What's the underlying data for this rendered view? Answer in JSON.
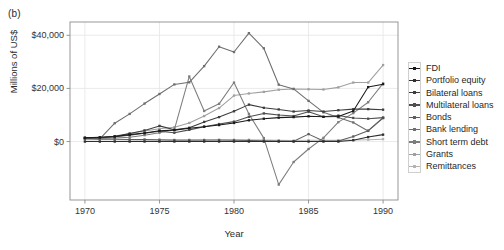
{
  "panel_label": "(b)",
  "colors": {
    "background": "#ffffff",
    "panel_border": "#8c8c8c",
    "grid_major": "#e8e8e8",
    "axis_text": "#333333",
    "legend_border": "#cfcfcf"
  },
  "chart_data": {
    "type": "line",
    "title": "",
    "xlabel": "Year",
    "ylabel": "Millions of US$",
    "xlim": [
      1969,
      1991
    ],
    "ylim": [
      -22000,
      45000
    ],
    "xticks": [
      1970,
      1975,
      1980,
      1985,
      1990
    ],
    "xticklabels": [
      "1970",
      "1975",
      "1980",
      "1985",
      "1990"
    ],
    "yticks": [
      0,
      20000,
      40000
    ],
    "yticklabels": [
      "$0",
      "$20,000",
      "$40,000"
    ],
    "grid": true,
    "legend_position": "right",
    "x": [
      1970,
      1971,
      1972,
      1973,
      1974,
      1975,
      1976,
      1977,
      1978,
      1979,
      1980,
      1981,
      1982,
      1983,
      1984,
      1985,
      1986,
      1987,
      1988,
      1989,
      1990
    ],
    "series": [
      {
        "name": "FDI",
        "color": "#1a1a1a",
        "values": [
          1400,
          1600,
          1900,
          2600,
          3200,
          4100,
          4300,
          5000,
          5600,
          6200,
          7000,
          8000,
          8600,
          9000,
          9200,
          9500,
          9300,
          9400,
          11500,
          20500,
          21600
        ]
      },
      {
        "name": "Portfolio equity",
        "color": "#2e2e2e",
        "values": [
          0,
          0,
          0,
          0,
          0,
          0,
          0,
          0,
          0,
          0,
          0,
          0,
          0,
          0,
          0,
          0,
          0,
          0,
          500,
          1700,
          2600
        ]
      },
      {
        "name": "Bilateral loans",
        "color": "#3d3d3d",
        "values": [
          1300,
          1500,
          2000,
          3000,
          4200,
          5900,
          4400,
          5200,
          7400,
          9200,
          11400,
          13900,
          12700,
          12100,
          11300,
          11700,
          11300,
          11800,
          12200,
          12200,
          12000
        ]
      },
      {
        "name": "Multilateral loans",
        "color": "#4f4f4f",
        "values": [
          1200,
          1400,
          1800,
          2400,
          3100,
          3900,
          3300,
          4400,
          5600,
          6600,
          7500,
          9300,
          10600,
          10000,
          9600,
          11200,
          9300,
          9800,
          8900,
          8600,
          9000
        ]
      },
      {
        "name": "Bonds",
        "color": "#5e5e5e",
        "values": [
          1000,
          900,
          900,
          800,
          800,
          700,
          600,
          600,
          600,
          600,
          500,
          400,
          300,
          200,
          100,
          2800,
          200,
          200,
          1900,
          4100,
          9000
        ]
      },
      {
        "name": "Bank lending",
        "color": "#6e6e6e",
        "values": [
          1500,
          1000,
          6900,
          10400,
          14300,
          17900,
          21500,
          22300,
          28400,
          35700,
          33700,
          40800,
          35100,
          21400,
          19800,
          15300,
          11000,
          9100,
          7200,
          4000,
          8800
        ]
      },
      {
        "name": "Short term debt",
        "color": "#7d7d7d",
        "values": [
          1400,
          1200,
          1300,
          1600,
          2400,
          3300,
          4500,
          24500,
          11500,
          14200,
          22200,
          10400,
          1300,
          -16200,
          -7700,
          -2800,
          1400,
          7300,
          10700,
          14800,
          21900
        ]
      },
      {
        "name": "Grants",
        "color": "#a0a0a0",
        "values": [
          1200,
          1400,
          1700,
          3000,
          4000,
          4800,
          5400,
          7000,
          9600,
          12600,
          17300,
          18100,
          18700,
          19500,
          19800,
          19700,
          19600,
          20400,
          22200,
          22200,
          28800
        ]
      },
      {
        "name": "Remittances",
        "color": "#b4b4b4",
        "values": [
          100,
          100,
          150,
          200,
          250,
          300,
          350,
          400,
          500,
          600,
          700,
          700,
          600,
          500,
          400,
          500,
          500,
          500,
          600,
          700,
          900
        ]
      }
    ]
  },
  "legend": {
    "items": [
      {
        "label": "FDI"
      },
      {
        "label": "Portfolio equity"
      },
      {
        "label": "Bilateral loans"
      },
      {
        "label": "Multilateral loans"
      },
      {
        "label": "Bonds"
      },
      {
        "label": "Bank lending"
      },
      {
        "label": "Short term debt"
      },
      {
        "label": "Grants"
      },
      {
        "label": "Remittances"
      }
    ]
  }
}
